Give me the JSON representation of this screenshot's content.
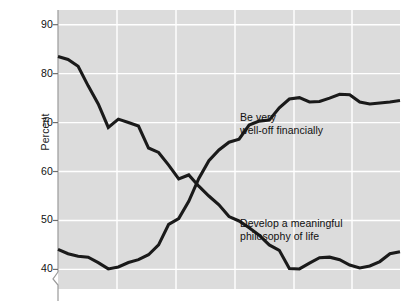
{
  "chart_data": {
    "type": "line",
    "title": "",
    "subtitle": "",
    "xlabel": "",
    "ylabel": "Percent",
    "ylim": [
      36,
      93
    ],
    "yticks": [
      40,
      50,
      60,
      70,
      80,
      90
    ],
    "ytick_labels": [
      "40",
      "50",
      "60",
      "70",
      "80",
      "90"
    ],
    "grid": true,
    "grid_orientation": "both",
    "legend_position": "inline-annotations",
    "y_axis_break": true,
    "plot_background": "#dcdcdc",
    "line_color": "#1a1a1a",
    "grid_color": "#ffffff",
    "x": [
      0,
      1,
      2,
      3,
      4,
      5,
      6,
      7,
      8,
      9,
      10,
      11,
      12,
      13,
      14,
      15,
      16,
      17,
      18,
      19,
      20,
      21,
      22,
      23,
      24,
      25,
      26,
      27,
      28,
      29,
      30,
      31,
      32,
      33,
      34
    ],
    "series": [
      {
        "name": "Develop a meaningful philosophy of life",
        "label": "Develop a meaningful\nphilosophy of life",
        "label_x": 240,
        "label_y": 217,
        "values": [
          83.5,
          82.9,
          81.5,
          77.5,
          73.8,
          69.0,
          70.7,
          70.0,
          69.3,
          64.8,
          63.9,
          61.3,
          58.5,
          59.3,
          57.0,
          55.0,
          53.2,
          50.8,
          49.9,
          48.5,
          47.0,
          45.0,
          43.9,
          40.2,
          40.1,
          41.3,
          42.4,
          42.5,
          42.0,
          40.9,
          40.3,
          40.7,
          41.6,
          43.2,
          43.6
        ]
      },
      {
        "name": "Be very well-off financially",
        "label": "Be very\nwell-off financially",
        "label_x": 240,
        "label_y": 111,
        "values": [
          44.1,
          43.2,
          42.7,
          42.5,
          41.4,
          40.1,
          40.5,
          41.4,
          42.0,
          43.0,
          45.0,
          49.2,
          50.4,
          53.9,
          58.6,
          62.2,
          64.4,
          66.0,
          66.6,
          69.5,
          70.3,
          70.5,
          73.0,
          74.8,
          75.1,
          74.2,
          74.3,
          75.0,
          75.8,
          75.7,
          74.2,
          73.8,
          74.0,
          74.2,
          74.5
        ]
      }
    ]
  }
}
